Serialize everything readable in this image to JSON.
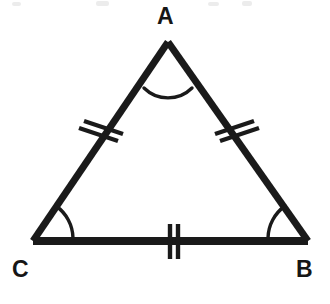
{
  "figure": {
    "background_color": "#ffffff",
    "stroke_color": "#1a1a1a",
    "label_color": "#161616"
  },
  "labels": {
    "apex": "A",
    "bottom_left": "C",
    "bottom_right": "B"
  },
  "geometry": {
    "vertices": {
      "A": {
        "x": 168,
        "y": 42
      },
      "B": {
        "x": 308,
        "y": 241
      },
      "C": {
        "x": 33,
        "y": 241
      }
    },
    "side_stroke_width": 7,
    "marking_stroke_width": 4,
    "arc_stroke_width": 3.4
  },
  "markings": {
    "angle_arcs": [
      {
        "vertex": "A",
        "name": "angle-arc-a"
      },
      {
        "vertex": "B",
        "name": "angle-arc-b"
      },
      {
        "vertex": "C",
        "name": "angle-arc-c"
      }
    ],
    "side_ticks": [
      {
        "side": "AC",
        "count": 2,
        "name": "tick-marks-side-ac"
      },
      {
        "side": "AB",
        "count": 2,
        "name": "tick-marks-side-ab"
      },
      {
        "side": "CB",
        "count": 2,
        "name": "tick-marks-side-cb"
      }
    ]
  },
  "artifacts": {
    "top_edge_smudges": [
      {
        "x": 12,
        "y": 2,
        "w": 9,
        "h": 4
      },
      {
        "x": 96,
        "y": 1,
        "w": 13,
        "h": 5
      },
      {
        "x": 208,
        "y": 2,
        "w": 11,
        "h": 4
      },
      {
        "x": 242,
        "y": 1,
        "w": 10,
        "h": 5
      }
    ],
    "color": "#ececec"
  }
}
